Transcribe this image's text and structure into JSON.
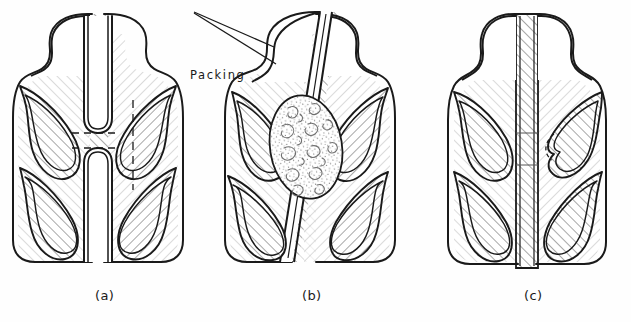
{
  "figure": {
    "kind": "line-drawing",
    "background_color": "#fefefe",
    "ink_color": "#1a1a1a",
    "hatch_color": "#555555",
    "hatch_angle_deg": 45,
    "stipple_color": "#6b6b6b"
  },
  "annotations": {
    "packing": {
      "label": "Packing",
      "leader": "two-line wedge leader pointing right-down to stippled packing mass in panel b"
    }
  },
  "panels": [
    {
      "id": "a",
      "caption": "(a)",
      "center_column": "straight vertical hatched web with two blind slots facing each other",
      "features": [
        "dashed horizontal tick at upper slot tip",
        "dashed horizontal tick at lower slot tip",
        "dashed vertical line in right upper lobe"
      ]
    },
    {
      "id": "b",
      "caption": "(b)",
      "center_column": "tilted hatched web, gap filled by stippled packing mass",
      "features": [
        "stippled packing oval",
        "packing leader line"
      ]
    },
    {
      "id": "c",
      "caption": "(c)",
      "center_column": "straight continuous hatched web, full thickness",
      "features": [
        "dashed arc on right middle lobe",
        "two faint horizontal tick marks across central web"
      ]
    }
  ],
  "captions": {
    "a": "(a)",
    "b": "(b)",
    "c": "(c)"
  }
}
